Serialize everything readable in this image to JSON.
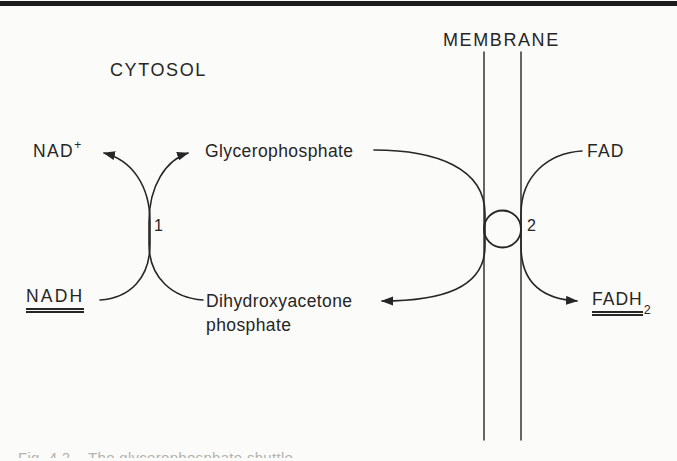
{
  "colors": {
    "ink": "#262626",
    "paper": "#fbfbf9"
  },
  "figure": {
    "region_labels": {
      "cytosol": "CYTOSOL",
      "membrane": "MEMBRANE"
    },
    "reaction_1": {
      "number": "1",
      "nad": {
        "text": "NAD",
        "superscript": "+"
      },
      "nadh": "NADH",
      "glycerophosphate": "Glycerophosphate",
      "dihydroxyacetone_phosphate": {
        "line1": "Dihydroxyacetone",
        "line2": "phosphate"
      }
    },
    "reaction_2": {
      "number": "2",
      "fad": "FAD",
      "fadh2": {
        "text": "FADH",
        "subscript": "2"
      }
    },
    "caption_fragment": "Fig. 4.2    The glycerophosphate shuttle"
  }
}
